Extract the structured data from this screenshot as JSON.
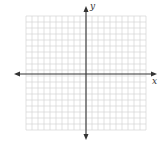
{
  "diagram": {
    "type": "coordinate-grid",
    "x_axis_label": "x",
    "y_axis_label": "y",
    "grid": {
      "columns": 20,
      "rows": 19,
      "cell_px": 6,
      "left": 26,
      "top": 16,
      "right": 146,
      "bottom": 130
    },
    "origin_px": {
      "x": 86,
      "y": 74
    },
    "colors": {
      "grid": "#d4d4d4",
      "axis": "#333333"
    }
  }
}
